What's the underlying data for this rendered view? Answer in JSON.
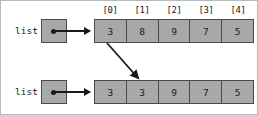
{
  "diagram": {
    "colors": {
      "cell_fill": "#a8a8a8",
      "stroke": "#4a4a4a",
      "ink": "#1a1a1a",
      "background": "#ffffff"
    },
    "index_labels": [
      "[0]",
      "[1]",
      "[2]",
      "[3]",
      "[4]"
    ],
    "rows": [
      {
        "variable_label": "list",
        "values": [
          "3",
          "8",
          "9",
          "7",
          "5"
        ]
      },
      {
        "variable_label": "list",
        "values": [
          "3",
          "3",
          "9",
          "7",
          "5"
        ]
      }
    ],
    "copy_arrow": {
      "from_index": "[0]",
      "to_index": "[1]",
      "x1": 106,
      "y1": 42,
      "x2": 139,
      "y2": 79
    }
  }
}
